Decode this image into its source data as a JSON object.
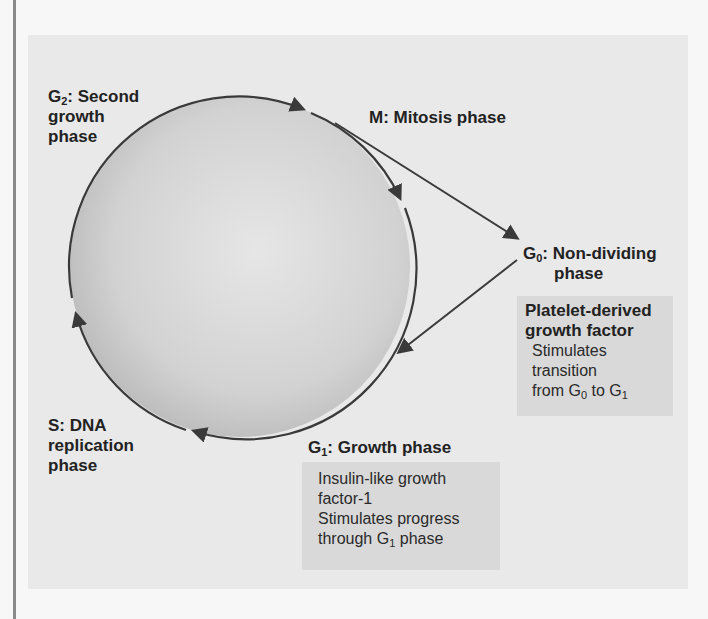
{
  "diagram": {
    "colors": {
      "page_background": "#f7f7f7",
      "panel_background": "#e9e9e9",
      "note_background": "#d9d9d9",
      "arrow": "#3a3a3a",
      "circle_center": "#e4e4e4",
      "circle_edge": "#b8b8b8"
    },
    "phases": {
      "g2": {
        "letter": "G",
        "sub": "2",
        "rest": ": Second",
        "line2": "growth",
        "line3": "phase"
      },
      "m": {
        "text": "M: Mitosis phase"
      },
      "g0": {
        "letter": "G",
        "sub": "0",
        "rest": ": Non-dividing",
        "line2": "phase"
      },
      "s": {
        "line1": "S: DNA",
        "line2": "replication",
        "line3": "phase"
      },
      "g1": {
        "letter": "G",
        "sub": "1",
        "rest": ": Growth phase"
      }
    },
    "notes": {
      "pdgf": {
        "title_line1": "Platelet-derived",
        "title_line2": "growth factor",
        "body_line1": "Stimulates",
        "body_line2": "transition",
        "body_line3_a": "from G",
        "body_line3_sub1": "0",
        "body_line3_b": " to G",
        "body_line3_sub2": "1"
      },
      "igf": {
        "line1": "Insulin-like growth",
        "line2": "factor-1",
        "line3": "Stimulates progress",
        "line4_a": "through G",
        "line4_sub": "1",
        "line4_b": " phase"
      }
    },
    "edges": [
      {
        "from": "G2",
        "to": "M"
      },
      {
        "from": "M",
        "to": "G1"
      },
      {
        "from": "M",
        "to": "G0"
      },
      {
        "from": "G0",
        "to": "G1"
      },
      {
        "from": "G1",
        "to": "S"
      },
      {
        "from": "S",
        "to": "G2"
      }
    ]
  }
}
